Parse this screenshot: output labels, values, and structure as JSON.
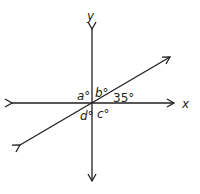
{
  "diagram": {
    "axes": {
      "x_label": "x",
      "y_label": "y"
    },
    "angles": {
      "a": "a°",
      "b": "b°",
      "c": "c°",
      "d": "d°",
      "given": "35°"
    },
    "colors": {
      "line": "#231f20",
      "background": "#ffffff"
    }
  }
}
